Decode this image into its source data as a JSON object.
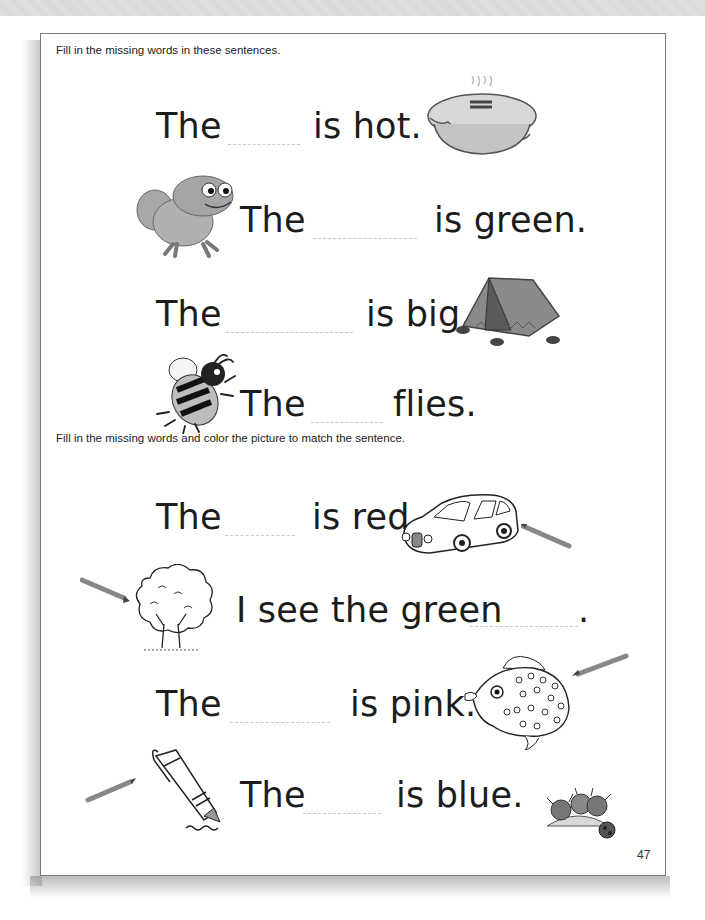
{
  "worksheet": {
    "section1": {
      "instruction": "Fill in the missing words in these sentences.",
      "rows": [
        {
          "before": "The",
          "after": "is hot.",
          "picture": "pie"
        },
        {
          "before": "The",
          "after": "is green.",
          "picture": "frog"
        },
        {
          "before": "The",
          "after": "is big.",
          "picture": "tent"
        },
        {
          "before": "The",
          "after": "flies.",
          "picture": "bee"
        }
      ]
    },
    "section2": {
      "instruction": "Fill in the missing words and color the picture to match the sentence.",
      "rows": [
        {
          "before": "The",
          "after": "is red.",
          "picture": "car"
        },
        {
          "before": "I see the green",
          "after": ".",
          "picture": "tree"
        },
        {
          "before": "The",
          "after": "is pink.",
          "picture": "fish"
        },
        {
          "before": "The",
          "after": "is blue.",
          "picture": "pen"
        }
      ],
      "extra_picture": "bugs"
    },
    "page_number": "47"
  },
  "colors": {
    "page_border": "#7a7a7a",
    "text": "#1c1c1c",
    "blank_line": "#c9c9c9",
    "top_band": "#dcdcdc"
  }
}
